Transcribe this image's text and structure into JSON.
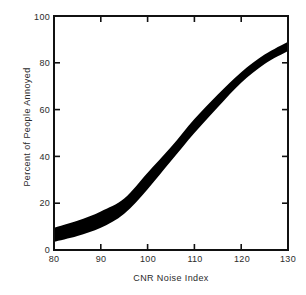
{
  "figure": {
    "name": "annoyance-dose-response-chart"
  },
  "chart_data": {
    "type": "area",
    "title": "",
    "xlabel": "CNR Noise Index",
    "ylabel": "Percent of People Annoyed",
    "xlim": [
      80,
      130
    ],
    "ylim": [
      0,
      100
    ],
    "xticks": [
      80,
      90,
      100,
      110,
      120,
      130
    ],
    "yticks": [
      0,
      20,
      40,
      60,
      80,
      100
    ],
    "xtick_labels": [
      "80",
      "90",
      "100",
      "110",
      "120",
      "130"
    ],
    "ytick_labels": [
      "0",
      "20",
      "40",
      "60",
      "80",
      "100"
    ],
    "grid": false,
    "legend": null,
    "tick_direction": "in",
    "frame": "box",
    "band_color": "#000000",
    "series": [
      {
        "name": "Percent highly annoyed (upper bound)",
        "x": [
          80,
          85,
          90,
          95,
          100,
          105,
          110,
          115,
          120,
          125,
          130
        ],
        "values": [
          9.5,
          12.5,
          16.5,
          22.0,
          33.0,
          44.0,
          56.0,
          66.5,
          76.0,
          83.5,
          89.0
        ]
      },
      {
        "name": "Percent highly annoyed (lower bound)",
        "x": [
          80,
          85,
          90,
          95,
          100,
          105,
          110,
          115,
          120,
          125,
          130
        ],
        "values": [
          3.5,
          6.0,
          9.5,
          15.5,
          26.0,
          38.0,
          50.0,
          61.0,
          71.5,
          79.5,
          85.0
        ]
      }
    ]
  }
}
